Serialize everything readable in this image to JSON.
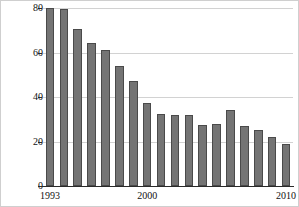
{
  "chart_data": {
    "type": "bar",
    "title": "",
    "xlabel": "",
    "ylabel": "Victimization rate (per 1,000)",
    "categories": [
      "1993",
      "1994",
      "1995",
      "1996",
      "1997",
      "1998",
      "1999",
      "2000",
      "2001",
      "2002",
      "2003",
      "2004",
      "2005",
      "2006",
      "2007",
      "2008",
      "2009",
      "2010"
    ],
    "values": [
      80,
      79.5,
      70.5,
      64.5,
      61,
      54,
      47,
      37.5,
      32.5,
      32,
      32,
      27.5,
      28,
      34,
      27,
      25,
      22,
      19
    ],
    "ylim": [
      0,
      80
    ],
    "ytick_labels": [
      "0",
      "20",
      "40",
      "60",
      "80"
    ],
    "ytick_values": [
      0,
      20,
      40,
      60,
      80
    ],
    "xtick_labels": [
      "1993",
      "2000",
      "2010"
    ],
    "xtick_values": [
      "1993",
      "2000",
      "2010"
    ],
    "grid": true,
    "legend": "none",
    "bar_color": "#747474",
    "bar_edge_color": "#4a4a4a",
    "grid_color": "#d2d2d2",
    "axis_color": "#2a2a2a",
    "background_color": "#ffffff"
  }
}
